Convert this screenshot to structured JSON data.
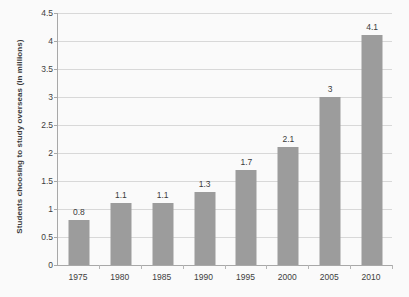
{
  "chart_data": {
    "type": "bar",
    "title": "",
    "subtitle": "",
    "xlabel": "",
    "ylabel": "Students choosing to study overseas (in millions)",
    "categories": [
      "1975",
      "1980",
      "1985",
      "1990",
      "1995",
      "2000",
      "2005",
      "2010"
    ],
    "values": [
      0.8,
      1.1,
      1.1,
      1.3,
      1.7,
      2.1,
      3,
      4.1
    ],
    "value_labels": [
      "0.8",
      "1.1",
      "1.1",
      "1.3",
      "1.7",
      "2.1",
      "3",
      "4.1"
    ],
    "ylim": [
      0,
      4.5
    ],
    "y_ticks": [
      0,
      0.5,
      1,
      1.5,
      2,
      2.5,
      3,
      3.5,
      4,
      4.5
    ],
    "y_tick_labels": [
      "0",
      "0.5",
      "1",
      "1.5",
      "2",
      "2.5",
      "3",
      "3.5",
      "4",
      "4.5"
    ],
    "grid": true,
    "legend": false,
    "legend_position": "none",
    "series": [
      {
        "name": "Students choosing to study overseas (in millions)",
        "values": [
          0.8,
          1.1,
          1.1,
          1.3,
          1.7,
          2.1,
          3,
          4.1
        ],
        "color": "#9c9c9c"
      }
    ]
  },
  "colors": {
    "bar_fill": "#9c9c9c",
    "gridline": "#d8d8d8",
    "axis_line": "#a8a8a8",
    "text": "#404040",
    "background": "#fafafa"
  }
}
